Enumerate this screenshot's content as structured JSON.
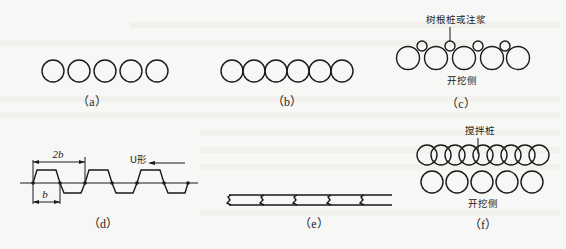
{
  "figure": {
    "panels": [
      {
        "id": "a",
        "caption": "（a）",
        "description": "5 separated circular piles in a row"
      },
      {
        "id": "b",
        "caption": "（b）",
        "description": "6 tangent circular piles in a row"
      },
      {
        "id": "c",
        "caption": "（c）",
        "label_top": "树根桩或注浆",
        "label_bottom": "开挖侧",
        "description": "5 spaced piles with small root piles or grouting between them"
      },
      {
        "id": "d",
        "caption": "（d）",
        "dim_2b": "2b",
        "dim_b": "b",
        "label_u": "U形",
        "description": "U-shaped sheet pile profile with dimensions"
      },
      {
        "id": "e",
        "caption": "（e）",
        "description": "interlocking sheet pile wall (plan)"
      },
      {
        "id": "f",
        "caption": "（f）",
        "label_top": "搅拌桩",
        "label_bottom": "开挖侧",
        "description": "overlapping mixing piles behind a row of bored piles"
      }
    ]
  },
  "colors": {
    "background": "#f7f7f5",
    "line": "#1a1a1a"
  }
}
